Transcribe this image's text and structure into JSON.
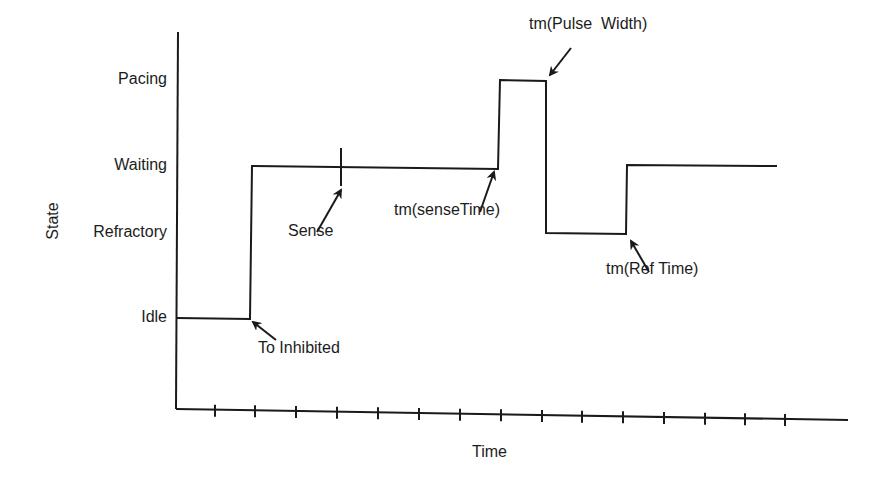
{
  "diagram": {
    "y_axis_title": "State",
    "x_axis_title": "Time",
    "states": [
      {
        "label": "Pacing",
        "y": 80
      },
      {
        "label": "Waiting",
        "y": 166
      },
      {
        "label": "Refractory",
        "y": 233
      },
      {
        "label": "Idle",
        "y": 318
      }
    ],
    "axes": {
      "origin": [
        176,
        409
      ],
      "y_axis_top": 32,
      "x_axis_end": [
        848,
        420
      ],
      "tick_xs": [
        215,
        255,
        296,
        337,
        378,
        419,
        460,
        501,
        542,
        582,
        623,
        664,
        705,
        745,
        785
      ],
      "tick_half": 5
    },
    "waveform": {
      "points": [
        [
          177,
          318
        ],
        [
          250,
          319
        ],
        [
          252,
          166
        ],
        [
          498,
          169
        ],
        [
          500,
          80
        ],
        [
          546,
          81
        ],
        [
          546,
          233
        ],
        [
          626,
          234
        ],
        [
          627,
          165
        ],
        [
          777,
          166
        ]
      ],
      "stroke": "#1a1a1a"
    },
    "sense_marker": {
      "x": 341,
      "y1": 148,
      "y2": 186
    },
    "annotations": [
      {
        "label": "To Inhibited",
        "text_x": 258,
        "text_y": 356,
        "arrow_from": [
          276,
          340
        ],
        "arrow_to": [
          253,
          322
        ]
      },
      {
        "label": "Sense",
        "text_x": 288,
        "text_y": 239,
        "arrow_from": [
          317,
          232
        ],
        "arrow_to": [
          341,
          190
        ]
      },
      {
        "label": "tm(senseTime)",
        "text_x": 394,
        "text_y": 218,
        "arrow_from": [
          480,
          212
        ],
        "arrow_to": [
          494,
          172
        ]
      },
      {
        "label": "tm(Pulse  Width)",
        "text_x": 529,
        "text_y": 32,
        "arrow_from": [
          571,
          48
        ],
        "arrow_to": [
          550,
          75
        ]
      },
      {
        "label": "tm(Ref Time)",
        "text_x": 606,
        "text_y": 277,
        "arrow_from": [
          649,
          272
        ],
        "arrow_to": [
          631,
          241
        ]
      }
    ],
    "time_label_pos": [
      472,
      457
    ]
  }
}
